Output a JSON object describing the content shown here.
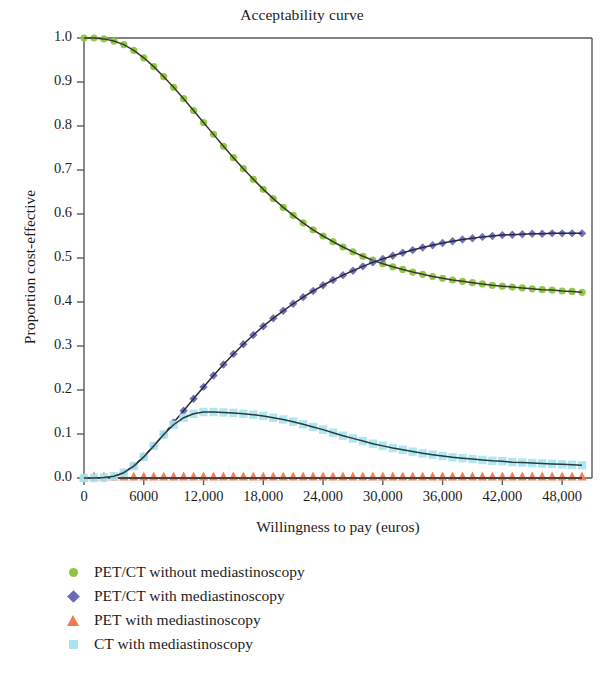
{
  "chart_data": {
    "type": "line",
    "title": "Acceptability curve",
    "xlabel": "Willingness to pay (euros)",
    "ylabel": "Proportion cost-effective",
    "xlim": [
      0,
      51000
    ],
    "ylim": [
      0.0,
      1.0
    ],
    "grid": false,
    "legend_position": "below-left",
    "xticks": [
      0,
      6000,
      12000,
      18000,
      24000,
      30000,
      36000,
      42000,
      48000
    ],
    "xtick_labels": [
      "0",
      "6000",
      "12,000",
      "18,000",
      "24,000",
      "30,000",
      "36,000",
      "42,000",
      "48,000"
    ],
    "yticks": [
      0.0,
      0.1,
      0.2,
      0.3,
      0.4,
      0.5,
      0.6,
      0.7,
      0.8,
      0.9,
      1.0
    ],
    "ytick_labels": [
      "0.0",
      "0.1",
      "0.2",
      "0.3",
      "0.4",
      "0.5",
      "0.6",
      "0.7",
      "0.8",
      "0.9",
      "1.0"
    ],
    "x": [
      0,
      1000,
      2000,
      3000,
      4000,
      5000,
      6000,
      7000,
      8000,
      9000,
      10000,
      11000,
      12000,
      13000,
      14000,
      15000,
      16000,
      17000,
      18000,
      19000,
      20000,
      21000,
      22000,
      23000,
      24000,
      25000,
      26000,
      27000,
      28000,
      29000,
      30000,
      31000,
      32000,
      33000,
      34000,
      35000,
      36000,
      37000,
      38000,
      39000,
      40000,
      41000,
      42000,
      43000,
      44000,
      45000,
      46000,
      47000,
      48000,
      49000,
      50000
    ],
    "series": [
      {
        "name": "PET/CT without mediastinoscopy",
        "marker": "circle",
        "color": "#8cc63f",
        "line_color": "#3a3a2a",
        "values": [
          1.0,
          1.0,
          0.998,
          0.993,
          0.985,
          0.972,
          0.955,
          0.935,
          0.912,
          0.888,
          0.862,
          0.835,
          0.808,
          0.781,
          0.754,
          0.728,
          0.703,
          0.679,
          0.656,
          0.635,
          0.615,
          0.597,
          0.58,
          0.564,
          0.55,
          0.537,
          0.525,
          0.514,
          0.504,
          0.495,
          0.487,
          0.48,
          0.474,
          0.468,
          0.463,
          0.458,
          0.454,
          0.45,
          0.447,
          0.444,
          0.441,
          0.438,
          0.436,
          0.434,
          0.432,
          0.43,
          0.428,
          0.427,
          0.425,
          0.424,
          0.422
        ]
      },
      {
        "name": "PET/CT with mediastinoscopy",
        "marker": "diamond",
        "color": "#6a6ab4",
        "line_color": "#2b2b3f",
        "values": [
          0.0,
          0.0,
          0.0,
          0.003,
          0.012,
          0.028,
          0.049,
          0.073,
          0.099,
          0.126,
          0.153,
          0.18,
          0.207,
          0.233,
          0.258,
          0.282,
          0.304,
          0.325,
          0.345,
          0.363,
          0.38,
          0.396,
          0.411,
          0.425,
          0.438,
          0.45,
          0.461,
          0.471,
          0.481,
          0.49,
          0.498,
          0.505,
          0.512,
          0.518,
          0.524,
          0.529,
          0.534,
          0.538,
          0.542,
          0.545,
          0.548,
          0.55,
          0.552,
          0.553,
          0.554,
          0.555,
          0.555,
          0.556,
          0.556,
          0.556,
          0.556
        ]
      },
      {
        "name": "PET with mediastinoscopy",
        "marker": "triangle",
        "color": "#ef7a50",
        "line_color": "#2a2a2a",
        "values": [
          0.0,
          0.0,
          0.0,
          0.0,
          0.0,
          0.0,
          0.0,
          0.0,
          0.0,
          0.0,
          0.0,
          0.0,
          0.0,
          0.0,
          0.0,
          0.0,
          0.0,
          0.0,
          0.0,
          0.0,
          0.0,
          0.0,
          0.0,
          0.0,
          0.0,
          0.0,
          0.0,
          0.0,
          0.0,
          0.0,
          0.0,
          0.0,
          0.0,
          0.0,
          0.0,
          0.0,
          0.0,
          0.0,
          0.0,
          0.0,
          0.0,
          0.0,
          0.0,
          0.0,
          0.0,
          0.0,
          0.0,
          0.0,
          0.0,
          0.0,
          0.0
        ]
      },
      {
        "name": "CT with mediastinoscopy",
        "marker": "square",
        "color": "#a9e4f0",
        "line_color": "#2a3a3f",
        "values": [
          0.0,
          0.0,
          0.001,
          0.004,
          0.012,
          0.027,
          0.048,
          0.073,
          0.099,
          0.121,
          0.137,
          0.146,
          0.15,
          0.15,
          0.149,
          0.148,
          0.146,
          0.144,
          0.141,
          0.137,
          0.133,
          0.128,
          0.122,
          0.116,
          0.11,
          0.103,
          0.096,
          0.09,
          0.084,
          0.078,
          0.073,
          0.068,
          0.064,
          0.06,
          0.056,
          0.053,
          0.05,
          0.047,
          0.045,
          0.043,
          0.041,
          0.039,
          0.038,
          0.036,
          0.035,
          0.034,
          0.033,
          0.032,
          0.031,
          0.03,
          0.029
        ]
      }
    ]
  },
  "legend": {
    "items": [
      {
        "label": "PET/CT without mediastinoscopy",
        "marker": "circle-marker",
        "color": "#8cc63f"
      },
      {
        "label": "PET/CT with mediastinoscopy",
        "marker": "diamond-marker",
        "color": "#6a6ab4"
      },
      {
        "label": "PET with mediastinoscopy",
        "marker": "triangle-marker",
        "color": "#ef7a50"
      },
      {
        "label": "CT with mediastinoscopy",
        "marker": "square-marker",
        "color": "#a9e4f0"
      }
    ]
  },
  "axes": {
    "frame_color": "#58595b"
  }
}
